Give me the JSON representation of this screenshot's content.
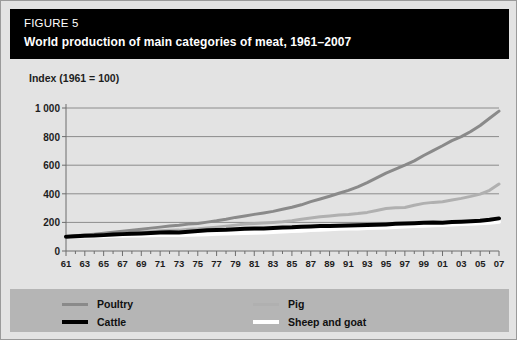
{
  "header": {
    "figure_label": "FIGURE 5",
    "title": "World production of main categories of meat, 1961–2007"
  },
  "colors": {
    "panel_background": "#e3e3e3",
    "header_background": "#000000",
    "header_text": "#ffffff",
    "legend_background": "#b5b5b5",
    "grid": "#8c8c8c",
    "axis": "#6d6d6d",
    "poultry": "#8a8a8a",
    "pig": "#b0b0b0",
    "cattle": "#000000",
    "sheep_and_goat": "#ffffff"
  },
  "legend": {
    "items": [
      {
        "label": "Poultry",
        "color": "#8a8a8a",
        "thick": false
      },
      {
        "label": "Pig",
        "color": "#b0b0b0",
        "thick": false
      },
      {
        "label": "Cattle",
        "color": "#000000",
        "thick": true
      },
      {
        "label": "Sheep and goat",
        "color": "#ffffff",
        "thick": true
      }
    ]
  },
  "chart_data": {
    "type": "line",
    "title": "World production of main categories of meat, 1961–2007",
    "ylabel": "Index (1961 = 100)",
    "xlabel": "",
    "ylim": [
      0,
      1000
    ],
    "yticks": [
      0,
      200,
      400,
      600,
      800,
      1000
    ],
    "ytick_labels": [
      "0",
      "200",
      "400",
      "600",
      "800",
      "1 000"
    ],
    "xlim": [
      1961,
      2007
    ],
    "xticks": [
      1961,
      1963,
      1965,
      1967,
      1969,
      1971,
      1973,
      1975,
      1977,
      1979,
      1981,
      1983,
      1985,
      1987,
      1989,
      1991,
      1993,
      1995,
      1997,
      1999,
      2001,
      2003,
      2005,
      2007
    ],
    "xtick_labels": [
      "61",
      "63",
      "65",
      "67",
      "69",
      "71",
      "73",
      "75",
      "77",
      "79",
      "81",
      "83",
      "85",
      "87",
      "89",
      "91",
      "93",
      "95",
      "97",
      "99",
      "01",
      "03",
      "05",
      "07"
    ],
    "grid": true,
    "grid_axis": "y",
    "legend_position": "bottom",
    "x": [
      1961,
      1962,
      1963,
      1964,
      1965,
      1966,
      1967,
      1968,
      1969,
      1970,
      1971,
      1972,
      1973,
      1974,
      1975,
      1976,
      1977,
      1978,
      1979,
      1980,
      1981,
      1982,
      1983,
      1984,
      1985,
      1986,
      1987,
      1988,
      1989,
      1990,
      1991,
      1992,
      1993,
      1994,
      1995,
      1996,
      1997,
      1998,
      1999,
      2000,
      2001,
      2002,
      2003,
      2004,
      2005,
      2006,
      2007
    ],
    "series": [
      {
        "name": "Poultry",
        "color": "#8a8a8a",
        "width": 3,
        "values": [
          100,
          106,
          112,
          118,
          124,
          131,
          138,
          145,
          152,
          160,
          167,
          175,
          180,
          188,
          192,
          202,
          211,
          222,
          235,
          245,
          256,
          266,
          277,
          292,
          306,
          323,
          345,
          364,
          383,
          404,
          424,
          449,
          478,
          511,
          545,
          572,
          600,
          630,
          668,
          702,
          736,
          772,
          800,
          836,
          878,
          928,
          978
        ]
      },
      {
        "name": "Pig",
        "color": "#b0b0b0",
        "width": 3,
        "values": [
          100,
          104,
          108,
          110,
          114,
          119,
          124,
          128,
          131,
          136,
          142,
          145,
          146,
          152,
          155,
          161,
          167,
          174,
          181,
          188,
          192,
          196,
          200,
          204,
          212,
          222,
          230,
          239,
          245,
          252,
          256,
          262,
          270,
          283,
          297,
          302,
          304,
          320,
          333,
          340,
          345,
          356,
          368,
          382,
          398,
          424,
          468
        ]
      },
      {
        "name": "Cattle",
        "color": "#000000",
        "width": 4,
        "values": [
          100,
          103,
          107,
          108,
          111,
          115,
          118,
          121,
          123,
          126,
          129,
          131,
          130,
          135,
          140,
          145,
          146,
          148,
          152,
          156,
          157,
          158,
          161,
          164,
          166,
          170,
          172,
          174,
          175,
          177,
          178,
          180,
          181,
          183,
          186,
          190,
          192,
          194,
          197,
          199,
          198,
          202,
          205,
          208,
          212,
          218,
          228
        ]
      },
      {
        "name": "Sheep and goat",
        "color": "#ffffff",
        "width": 4,
        "values": [
          100,
          101,
          102,
          103,
          104,
          106,
          107,
          108,
          109,
          110,
          112,
          113,
          112,
          114,
          116,
          118,
          120,
          122,
          124,
          126,
          128,
          130,
          133,
          136,
          139,
          142,
          146,
          149,
          152,
          155,
          157,
          158,
          160,
          162,
          165,
          168,
          171,
          174,
          177,
          180,
          182,
          185,
          188,
          191,
          194,
          198,
          204
        ]
      }
    ]
  }
}
